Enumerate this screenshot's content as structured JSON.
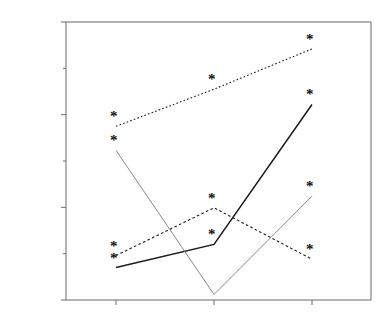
{
  "chart_data": {
    "type": "line",
    "title": "",
    "xlabel": "",
    "ylabel": "Correlation: Reach and nonreach speed",
    "categories": [
      "Early",
      "Active/Middle",
      "Stable"
    ],
    "ylim": [
      0.2,
      0.8
    ],
    "ytick_labels": [
      "0.20",
      "0.40",
      "0.60",
      "0.80"
    ],
    "ytick_values": [
      0.2,
      0.4,
      0.6,
      0.8
    ],
    "minor_ticks": [
      0.3,
      0.5,
      0.7
    ],
    "grid": false,
    "legend_position": "right-inline",
    "marker": "asterisk",
    "series": [
      {
        "name": "Justin",
        "linestyle": "dotted",
        "color": "#1a1a1a",
        "x": [
          "Early",
          "Active/Middle",
          "Stable"
        ],
        "values": [
          0.575,
          0.655,
          0.742
        ],
        "markers": [
          true,
          true,
          true
        ]
      },
      {
        "name": "Gabriel",
        "linestyle": "solid",
        "color": "#1a1a1a",
        "x": [
          "Early",
          "Active/Middle",
          "Stable"
        ],
        "values": [
          0.27,
          0.32,
          0.622
        ],
        "markers": [
          true,
          true,
          true
        ]
      },
      {
        "name": "Nathan",
        "linestyle": "solid-thin",
        "color": "#7a7a7a",
        "x": [
          "Early",
          "Active/Middle",
          "Stable"
        ],
        "values": [
          0.523,
          0.212,
          0.424
        ],
        "markers": [
          true,
          false,
          true
        ]
      },
      {
        "name": "Hannah",
        "linestyle": "dashed",
        "color": "#1a1a1a",
        "x": [
          "Early",
          "Active/Middle",
          "Stable"
        ],
        "values": [
          0.296,
          0.399,
          0.288
        ],
        "markers": [
          true,
          true,
          true
        ]
      }
    ],
    "annotations": [
      {
        "label": "Justin",
        "x": 0.855,
        "y": 0.685
      },
      {
        "label": "Gabriel",
        "x": 0.855,
        "y": 0.565
      },
      {
        "label": "Nathan",
        "x": 0.855,
        "y": 0.372
      },
      {
        "label": "Hannah",
        "x": 0.855,
        "y": 0.258
      }
    ]
  },
  "axes": {
    "y_labels": [
      "0.80",
      "0.60",
      "0.40",
      "0.20"
    ],
    "x_labels": [
      "Early",
      "Active/Middle",
      "Stable"
    ],
    "y_axis_title": "Correlation: Reach and nonreach speed"
  }
}
